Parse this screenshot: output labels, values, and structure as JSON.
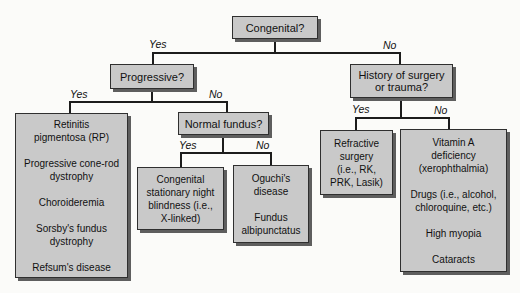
{
  "palette": {
    "background": "#fbfbf9",
    "box_fill": "#c9c9c9",
    "box_border": "#2f2f2f",
    "box_shadow": "#5e5e5e",
    "line": "#1c1c1c",
    "text": "#111111"
  },
  "labels": {
    "yes": "Yes",
    "no": "No"
  },
  "nodes": {
    "congenital": "Congenital?",
    "progressive": "Progressive?",
    "history": "History of surgery\nor trauma?",
    "normal_fundus": "Normal fundus?"
  },
  "leaves": {
    "progressive_yes": "Retinitis\npigmentosa (RP)\n\nProgressive cone-rod\ndystrophy\n\nChoroideremia\n\nSorsby's fundus\ndystrophy\n\nRefsum's disease",
    "fundus_yes": "Congenital\nstationary night\nblindness (i.e.,\nX-linked)",
    "fundus_no": "Oguchi's\ndisease\n\nFundus\nalbipunctatus",
    "history_yes": "Refractive\nsurgery\n(i.e., RK,\nPRK, Lasik)",
    "history_no": "Vitamin A\ndeficiency\n(xerophthalmia)\n\nDrugs (i.e., alcohol,\nchloroquine, etc.)\n\nHigh myopia\n\nCataracts"
  }
}
